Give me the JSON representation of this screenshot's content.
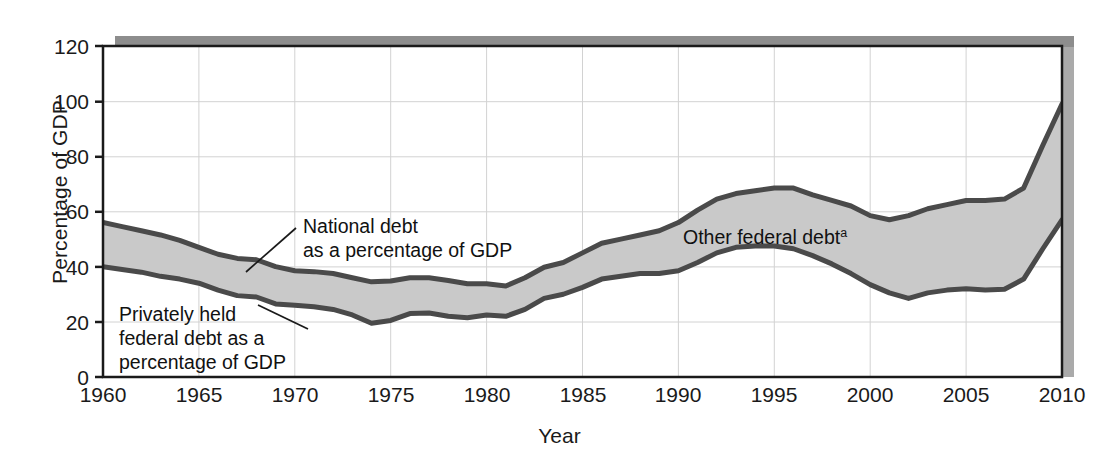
{
  "figure": {
    "top_cut_text": "",
    "axes": {
      "xlabel": "Year",
      "ylabel": "Percentage of GDP",
      "yticks": [
        "0",
        "20",
        "40",
        "60",
        "80",
        "100",
        "120"
      ],
      "xticks": [
        "1960",
        "1965",
        "1970",
        "1975",
        "1980",
        "1985",
        "1990",
        "1995",
        "2000",
        "2005",
        "2010"
      ]
    },
    "annotations": {
      "national_debt_line1": "National debt",
      "national_debt_line2": "as a percentage of GDP",
      "privately_held_line1": "Privately held",
      "privately_held_line2": "federal debt as a",
      "privately_held_line3": "percentage of GDP",
      "other_federal_debt": "Other federal debt",
      "other_federal_debt_footnote": "a"
    },
    "colors": {
      "band_fill": "#c9c9c9",
      "curve_outline": "#4a4a4a",
      "axis": "#1a1a1a",
      "gridline": "#d2d2d2",
      "shadow": "#8d8d8d"
    }
  },
  "chart_data": {
    "type": "area",
    "title": "",
    "xlabel": "Year",
    "ylabel": "Percentage of GDP",
    "xlim": [
      1960,
      2010
    ],
    "ylim": [
      0,
      120
    ],
    "ytick_step": 20,
    "xtick_step": 5,
    "grid": true,
    "legend": "annotated-inline",
    "x": [
      1960,
      1961,
      1962,
      1963,
      1964,
      1965,
      1966,
      1967,
      1968,
      1969,
      1970,
      1971,
      1972,
      1973,
      1974,
      1975,
      1976,
      1977,
      1978,
      1979,
      1980,
      1981,
      1982,
      1983,
      1984,
      1985,
      1986,
      1987,
      1988,
      1989,
      1990,
      1991,
      1992,
      1993,
      1994,
      1995,
      1996,
      1997,
      1998,
      1999,
      2000,
      2001,
      2002,
      2003,
      2004,
      2005,
      2006,
      2007,
      2008,
      2009,
      2010
    ],
    "series": [
      {
        "name": "National debt as a percentage of GDP",
        "values": [
          56.0,
          54.5,
          53.0,
          51.5,
          49.5,
          47.0,
          44.5,
          43.0,
          42.5,
          40.0,
          38.5,
          38.2,
          37.5,
          36.0,
          34.5,
          34.8,
          36.0,
          36.0,
          35.0,
          33.8,
          33.8,
          33.0,
          36.0,
          39.8,
          41.5,
          45.0,
          48.5,
          50.0,
          51.5,
          53.0,
          56.0,
          60.5,
          64.5,
          66.5,
          67.5,
          68.5,
          68.5,
          66.0,
          64.0,
          62.0,
          58.5,
          57.0,
          58.5,
          61.0,
          62.5,
          64.0,
          64.0,
          64.5,
          68.5,
          84.0,
          99.0
        ]
      },
      {
        "name": "Privately held federal debt as a percentage of GDP",
        "values": [
          40.0,
          39.0,
          38.0,
          36.5,
          35.5,
          34.0,
          31.5,
          29.5,
          29.0,
          26.5,
          26.0,
          25.5,
          24.5,
          22.5,
          19.5,
          20.5,
          23.0,
          23.2,
          22.0,
          21.5,
          22.5,
          22.0,
          24.5,
          28.5,
          30.0,
          32.5,
          35.5,
          36.5,
          37.5,
          37.5,
          38.5,
          41.5,
          45.0,
          47.0,
          47.5,
          47.5,
          46.5,
          44.0,
          41.0,
          37.5,
          33.5,
          30.5,
          28.5,
          30.5,
          31.5,
          32.0,
          31.5,
          31.8,
          35.5,
          46.5,
          57.0
        ]
      }
    ],
    "band_between": [
      "National debt as a percentage of GDP",
      "Privately held federal debt as a percentage of GDP"
    ],
    "band_label": "Other federal debt"
  }
}
